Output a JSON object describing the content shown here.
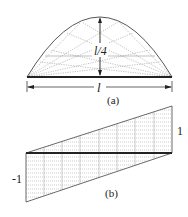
{
  "figure_a": {
    "caption": "(a)",
    "span_label": "l",
    "rise_label": "l/4",
    "shape": "parabolic arch",
    "span": {
      "x1": 27,
      "x2": 172,
      "y": 77
    },
    "apex": {
      "x": 100,
      "y": 17
    }
  },
  "figure_b": {
    "caption": "(b)",
    "right_value_label": "1",
    "left_value_label": "-1",
    "shape": "linear distribution trapezoid"
  },
  "colors": {
    "line": "#333333",
    "hatch": "#999999"
  }
}
